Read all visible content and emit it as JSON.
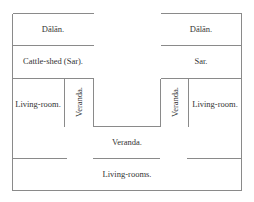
{
  "diagram": {
    "type": "floor-plan",
    "rooms": {
      "dalan_left": "Dālān.",
      "dalan_right": "Dālān.",
      "cattle_shed": "Cattle-shed (Sar).",
      "sar": "Sar.",
      "living_room_left": "Living-room.",
      "veranda_left": "Veranda.",
      "veranda_right": "Veranda.",
      "living_room_right": "Living-room.",
      "veranda_center": "Veranda.",
      "living_rooms": "Living-rooms."
    },
    "colors": {
      "line": "#8a8a8a",
      "text": "#333333",
      "background": "#ffffff"
    }
  }
}
